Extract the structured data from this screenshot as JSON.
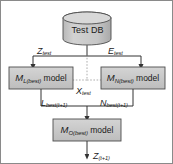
{
  "diagram": {
    "colors": {
      "node_fill": "#c9c9c9",
      "node_stroke": "#4d4d4d",
      "edge_stroke": "#333333",
      "dashed_stroke": "#9a9a9a",
      "frame_stroke": "#8a8a8a",
      "text": "#1a1a1a",
      "background": "#ffffff"
    },
    "nodes": {
      "database": {
        "shape": "cylinder",
        "label": "Test DB"
      },
      "model_left": {
        "shape": "rect",
        "symbol": "M",
        "subscript": "L(best)",
        "word": "model",
        "full_label": "M L(best) model"
      },
      "model_right": {
        "shape": "rect",
        "symbol": "M",
        "subscript": "N(best)",
        "word": "model",
        "full_label": "M N(best) model"
      },
      "model_bottom": {
        "shape": "rect",
        "symbol": "M",
        "subscript": "O(best)",
        "word": "model",
        "full_label": "M O(best) model"
      }
    },
    "edges": [
      {
        "id": "db-to-left",
        "symbol": "Z",
        "subscript": "test",
        "full_label": "Z test",
        "style": "solid"
      },
      {
        "id": "db-to-right",
        "symbol": "E",
        "subscript": "test",
        "full_label": "E test",
        "style": "solid"
      },
      {
        "id": "db-to-models-dashed",
        "symbol": "X",
        "subscript": "test",
        "full_label": "X test",
        "style": "dashed"
      },
      {
        "id": "left-to-bottom",
        "symbol": "L",
        "subscript": "best(t+1)",
        "full_label": "L best(t+1)",
        "style": "solid"
      },
      {
        "id": "right-to-bottom",
        "symbol": "N",
        "subscript": "best(t+1)",
        "full_label": "N best(t+1)",
        "style": "solid"
      },
      {
        "id": "bottom-output",
        "symbol": "Z",
        "subscript": "(t+1)",
        "full_label": "Z (t+1)",
        "style": "solid"
      }
    ]
  }
}
